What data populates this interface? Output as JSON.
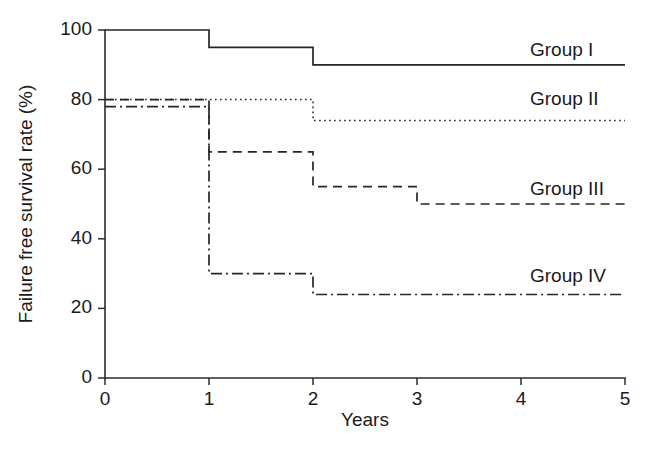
{
  "chart_data": {
    "type": "line",
    "subtype": "kaplan-meier-step",
    "title": "",
    "xlabel": "Years",
    "ylabel": "Failure free survival rate (%)",
    "xlim": [
      0,
      5
    ],
    "ylim": [
      0,
      100
    ],
    "xticks": [
      "0",
      "1",
      "2",
      "3",
      "4",
      "5"
    ],
    "yticks": [
      "0",
      "20",
      "40",
      "60",
      "80",
      "100"
    ],
    "grid": false,
    "legend_position": "inline-right",
    "x": [
      0,
      1,
      2,
      3,
      4,
      5
    ],
    "series": [
      {
        "name": "Group I",
        "style": "solid",
        "label_x": 5.0,
        "label_y": 94,
        "steps": [
          {
            "x0": 0,
            "x1": 1,
            "y": 100
          },
          {
            "x0": 1,
            "x1": 2,
            "y": 95
          },
          {
            "x0": 2,
            "x1": 5,
            "y": 90
          }
        ]
      },
      {
        "name": "Group II",
        "style": "dotted",
        "label_x": 5.0,
        "label_y": 80,
        "steps": [
          {
            "x0": 0,
            "x1": 2,
            "y": 80
          },
          {
            "x0": 2,
            "x1": 5,
            "y": 74
          }
        ]
      },
      {
        "name": "Group III",
        "style": "dashed",
        "label_x": 5.0,
        "label_y": 54,
        "steps": [
          {
            "x0": 0,
            "x1": 1,
            "y": 80
          },
          {
            "x0": 1,
            "x1": 2,
            "y": 65
          },
          {
            "x0": 2,
            "x1": 3,
            "y": 55
          },
          {
            "x0": 3,
            "x1": 5,
            "y": 50
          }
        ]
      },
      {
        "name": "Group IV",
        "style": "dashdot",
        "label_x": 5.0,
        "label_y": 29,
        "steps": [
          {
            "x0": 0,
            "x1": 1,
            "y": 78
          },
          {
            "x0": 1,
            "x1": 2,
            "y": 30
          },
          {
            "x0": 2,
            "x1": 5,
            "y": 24
          }
        ]
      }
    ],
    "colors": {
      "axis": "#2b2b2b",
      "curve": "#262626",
      "text": "#1a1a1a",
      "background": "#ffffff"
    }
  }
}
